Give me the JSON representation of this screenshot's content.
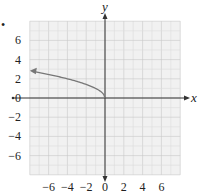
{
  "chart_data": {
    "type": "line",
    "title": "",
    "xlabel": "x",
    "ylabel": "y",
    "xlim": [
      -8,
      8
    ],
    "ylim": [
      -8,
      8
    ],
    "grid": true,
    "grid_minor_step": 1,
    "grid_major_step": 2,
    "x_ticks": [
      -6,
      -4,
      -2,
      0,
      2,
      4,
      6
    ],
    "y_ticks": [
      6,
      4,
      2,
      0,
      -2,
      -4,
      -6
    ],
    "x_tick_labels": [
      "−6",
      "−4",
      "−2",
      "0",
      "2",
      "4",
      "6"
    ],
    "y_tick_labels": [
      "6",
      "4",
      "2",
      "0",
      "−2",
      "−4",
      "−6"
    ],
    "series": [
      {
        "name": "y = √(−x)",
        "function": "sqrt(-x)",
        "domain": [
          -8,
          0
        ],
        "start_point": [
          0,
          0
        ],
        "arrow_end": [
          -8,
          2.83
        ],
        "color": "#777777",
        "x": [
          0,
          -0.25,
          -1,
          -2,
          -3,
          -4,
          -5,
          -6,
          -7,
          -8
        ],
        "y": [
          0,
          0.5,
          1,
          1.41,
          1.73,
          2,
          2.24,
          2.45,
          2.65,
          2.83
        ]
      }
    ],
    "legend": null,
    "marker": "•"
  },
  "colors": {
    "grid_bg": "#f1f1f1",
    "grid_minor": "#dcdcdc",
    "grid_major": "#c8c8c8",
    "axis": "#333333",
    "curve": "#777777"
  }
}
